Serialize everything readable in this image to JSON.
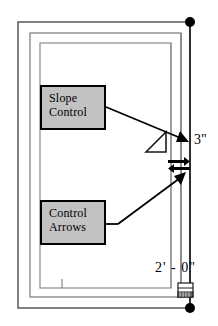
{
  "drawing": {
    "title": "Slope control and control arrows dimension detail",
    "background_color": "#ffffff",
    "line_color": "#4d4d4d",
    "accent_color": "#000000",
    "box_fill_color": "#c2c2c2"
  },
  "callouts": [
    {
      "id": "slope-control",
      "line1": "Slope",
      "line2": "Control",
      "x": 40,
      "y": 85,
      "width": 66,
      "height": 45
    },
    {
      "id": "control-arrows",
      "line1": "Control",
      "line2": "Arrows",
      "x": 40,
      "y": 200,
      "width": 66,
      "height": 45
    }
  ],
  "dimensions": [
    {
      "id": "vertical-dimension-3in",
      "value": "3\"",
      "x": 194,
      "y": 132
    },
    {
      "id": "horizontal-dimension-2ft",
      "value": "2' - 0\"",
      "x": 155,
      "y": 260
    }
  ],
  "symbols": {
    "slope_angle_icon": "slope-angle-symbol",
    "double_arrow_icon": "double-headed-arrow-symbol",
    "grip_dot_icon": "endpoint-grip-dot",
    "detail_tag_icon": "hatched-detail-tag"
  }
}
